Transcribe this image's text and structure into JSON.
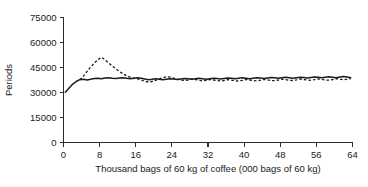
{
  "chart_data": {
    "type": "line",
    "title": "",
    "xlabel": "Thousand bags of 60 kg of coffee (000 bags of 60 kg)",
    "ylabel": "Periods",
    "xlim": [
      0,
      64
    ],
    "ylim": [
      0,
      75000
    ],
    "grid": false,
    "legend": "none",
    "xticks": [
      0,
      8,
      16,
      24,
      32,
      40,
      48,
      56,
      64
    ],
    "xtick_labels": [
      "0",
      "8",
      "16",
      "24",
      "32",
      "40",
      "48",
      "56",
      "64"
    ],
    "yticks": [
      0,
      15000,
      30000,
      45000,
      60000,
      75000
    ],
    "ytick_labels": [
      "0",
      "15000",
      "30000",
      "45000",
      "60000",
      "75000"
    ],
    "series": [
      {
        "name": "solid-series",
        "style": "solid",
        "color": "#1c1c1c",
        "x": [
          0.4,
          1.2,
          2.0,
          2.8,
          3.6,
          4.4,
          5.2,
          6.0,
          6.8,
          7.6,
          8.4,
          9.2,
          10.0,
          10.8,
          11.6,
          12.4,
          13.2,
          14.0,
          14.8,
          15.6,
          16.4,
          17.2,
          18.0,
          18.8,
          19.6,
          20.4,
          21.2,
          22.0,
          22.8,
          23.6,
          24.4,
          25.2,
          26.0,
          26.8,
          27.6,
          28.4,
          29.2,
          30.0,
          30.8,
          31.6,
          32.4,
          33.2,
          34.0,
          34.8,
          35.6,
          36.4,
          37.2,
          38.0,
          38.8,
          39.6,
          40.4,
          41.2,
          42.0,
          42.8,
          43.6,
          44.4,
          45.2,
          46.0,
          46.8,
          47.6,
          48.4,
          49.2,
          50.0,
          50.8,
          51.6,
          52.4,
          53.2,
          54.0,
          54.8,
          55.6,
          56.4,
          57.2,
          58.0,
          58.8,
          59.6,
          60.4,
          61.2,
          62.0,
          62.8,
          63.6
        ],
        "y": [
          30200,
          32600,
          34900,
          36600,
          37700,
          37900,
          37500,
          37900,
          38400,
          38500,
          38200,
          38700,
          38900,
          38500,
          38400,
          38700,
          38800,
          38500,
          38300,
          38600,
          38800,
          38500,
          38100,
          37700,
          37900,
          38300,
          38000,
          37700,
          38000,
          38300,
          38100,
          37800,
          38100,
          38400,
          38200,
          37900,
          38200,
          38500,
          38300,
          38000,
          38300,
          38600,
          38400,
          38100,
          38400,
          38700,
          38500,
          38200,
          38500,
          38800,
          38600,
          38300,
          38600,
          38900,
          38700,
          38400,
          38700,
          39000,
          38800,
          38500,
          38800,
          39100,
          38900,
          38600,
          38900,
          39200,
          39000,
          38700,
          39000,
          39300,
          39100,
          38800,
          39100,
          39400,
          39200,
          38900,
          39300,
          39600,
          39300,
          38900
        ]
      },
      {
        "name": "dashed-series",
        "style": "dashed",
        "color": "#1c1c1c",
        "x": [
          3.6,
          4.4,
          5.2,
          6.0,
          6.8,
          7.6,
          8.4,
          9.2,
          10.0,
          10.8,
          11.6,
          12.4,
          13.2,
          14.0,
          14.8,
          15.6,
          16.4,
          17.2,
          18.0,
          18.8,
          19.6,
          20.4,
          21.2,
          22.0,
          22.8,
          23.6,
          24.4,
          25.2,
          26.0,
          26.8,
          27.6,
          28.4,
          29.2,
          30.0,
          30.8,
          31.6,
          32.4,
          33.2,
          34.0,
          34.8,
          35.6,
          36.4,
          37.2,
          38.0,
          38.8,
          39.6,
          40.4,
          41.2,
          42.0,
          42.8,
          43.6,
          44.4,
          45.2,
          46.0,
          46.8,
          47.6,
          48.4,
          49.2,
          50.0,
          50.8,
          51.6,
          52.4,
          53.2,
          54.0,
          54.8,
          55.6,
          56.4,
          57.2,
          58.0,
          58.8,
          59.6,
          60.4,
          61.2,
          62.0,
          62.8,
          63.6
        ],
        "y": [
          37600,
          39800,
          42600,
          45200,
          47600,
          49700,
          51100,
          49600,
          47700,
          45900,
          44200,
          42600,
          41200,
          40000,
          39100,
          38500,
          38200,
          37500,
          36700,
          36300,
          36600,
          37300,
          38200,
          38900,
          39400,
          39200,
          38600,
          38000,
          37500,
          37200,
          37500,
          38100,
          37800,
          37300,
          37000,
          37300,
          37800,
          37500,
          37100,
          36900,
          37200,
          37700,
          37400,
          37000,
          36900,
          37300,
          37800,
          37500,
          37100,
          37000,
          37400,
          37900,
          37600,
          37200,
          37100,
          37500,
          38000,
          37700,
          37300,
          37200,
          37600,
          38100,
          37800,
          37400,
          37300,
          37700,
          38200,
          37900,
          37500,
          37400,
          37800,
          38300,
          38000,
          37600,
          38000,
          38400
        ]
      }
    ]
  },
  "axes": {
    "y_title": "Periods",
    "x_title": "Thousand bags of 60 kg of coffee (000 bags of 60 kg)"
  }
}
